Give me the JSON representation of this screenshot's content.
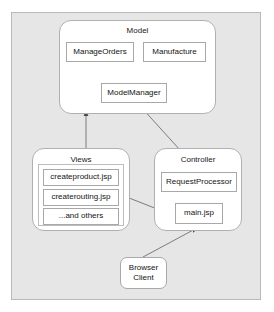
{
  "diagram": {
    "type": "architecture-block-diagram",
    "background_color": "#e6e6e6",
    "panel_border_color": "#b9b9b9",
    "node_fill_color": "#ffffff",
    "node_border_color": "#a8a8a8",
    "connector_color": "#555555"
  },
  "packages": {
    "model": {
      "label": "Model",
      "nodes": {
        "manage_orders": "ManageOrders",
        "manufacture": "Manufacture",
        "model_manager": "ModelManager"
      }
    },
    "views": {
      "label": "Views",
      "nodes": {
        "createproduct": "createproduct.jsp",
        "createrouting": "createrouting.jsp",
        "and_others": "...and others"
      }
    },
    "controller": {
      "label": "Controller",
      "nodes": {
        "request_processor": "RequestProcessor",
        "main_jsp": "main.jsp"
      }
    }
  },
  "terminals": {
    "browser_client": {
      "line1": "Browser",
      "line2": "Client"
    }
  },
  "connections": [
    {
      "from": "ModelManager",
      "to": "ManageOrders",
      "arrow": "ManageOrders"
    },
    {
      "from": "ModelManager",
      "to": "Manufacture",
      "arrow": "Manufacture"
    },
    {
      "from": "Views",
      "to": "ModelManager",
      "arrow": "ModelManager"
    },
    {
      "from": "RequestProcessor",
      "to": "ModelManager",
      "arrow": "ModelManager"
    },
    {
      "from": "main.jsp",
      "to": "RequestProcessor",
      "arrow": "RequestProcessor"
    },
    {
      "from": "Views",
      "to": "main.jsp",
      "arrow": "none"
    },
    {
      "from": "Browser Client",
      "to": "main.jsp",
      "arrow": "main.jsp"
    }
  ]
}
